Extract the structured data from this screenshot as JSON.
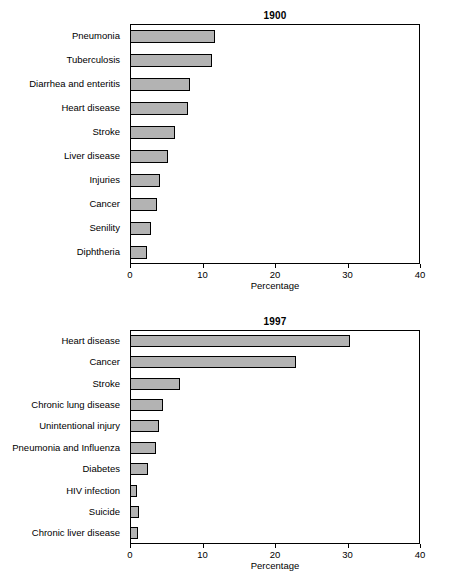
{
  "chart_data": [
    {
      "type": "bar",
      "orientation": "horizontal",
      "title": "1900",
      "xlabel": "Percentage",
      "ylabel": "",
      "xlim": [
        0,
        40
      ],
      "xticks": [
        0,
        10,
        20,
        30,
        40
      ],
      "grid": false,
      "categories": [
        "Pneumonia",
        "Tuberculosis",
        "Diarrhea and enteritis",
        "Heart disease",
        "Stroke",
        "Liver disease",
        "Injuries",
        "Cancer",
        "Senility",
        "Diphtheria"
      ],
      "values": [
        11.7,
        11.3,
        8.3,
        8.0,
        6.2,
        5.2,
        4.2,
        3.7,
        2.9,
        2.3
      ]
    },
    {
      "type": "bar",
      "orientation": "horizontal",
      "title": "1997",
      "xlabel": "Percentage",
      "ylabel": "",
      "xlim": [
        0,
        40
      ],
      "xticks": [
        0,
        10,
        20,
        30,
        40
      ],
      "grid": false,
      "categories": [
        "Heart disease",
        "Cancer",
        "Stroke",
        "Chronic lung disease",
        "Unintentional injury",
        "Pneumonia and Influenza",
        "Diabetes",
        "HIV infection",
        "Suicide",
        "Chronic liver disease"
      ],
      "values": [
        30.4,
        22.9,
        6.9,
        4.6,
        4.0,
        3.6,
        2.5,
        1.0,
        1.3,
        1.1
      ]
    }
  ],
  "style": {
    "bar_fill": "#b3b3b3",
    "bar_stroke": "#000000",
    "axis_color": "#000000",
    "background": "#ffffff"
  }
}
